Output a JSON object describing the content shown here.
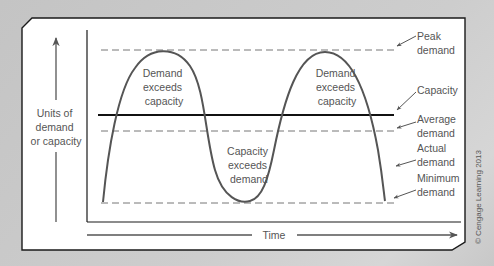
{
  "diagram": {
    "y_axis_label": [
      "Units of",
      "demand",
      "or capacity"
    ],
    "x_axis_label": "Time",
    "region_labels": {
      "demand_exceeds_capacity_1": [
        "Demand",
        "exceeds",
        "capacity"
      ],
      "demand_exceeds_capacity_2": [
        "Demand",
        "exceeds",
        "capacity"
      ],
      "capacity_exceeds_demand": [
        "Capacity",
        "exceeds",
        "demand"
      ]
    },
    "callouts": {
      "peak": [
        "Peak",
        "demand"
      ],
      "capacity": [
        "Capacity"
      ],
      "average": [
        "Average",
        "demand"
      ],
      "actual": [
        "Actual",
        "demand"
      ],
      "minimum": [
        "Minimum",
        "demand"
      ]
    },
    "copyright": "© Cengage Learning 2013",
    "colors": {
      "background": "#c9c9c9",
      "panel": "#ffffff",
      "frame": "#1a1a1a",
      "curve": "#555555",
      "dashed": "#777777",
      "capacity_line": "#111111",
      "text": "#555555"
    }
  }
}
